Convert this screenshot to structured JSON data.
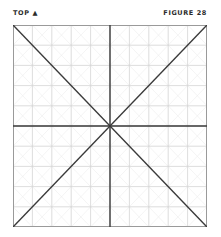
{
  "header": {
    "left_label": "TOP ▲",
    "right_label": "FIGURE 28"
  },
  "diagram": {
    "type": "grid-with-diagonals",
    "rows": 10,
    "columns": 10,
    "lines": [
      "diagonal-top-left-to-bottom-right",
      "diagonal-top-right-to-bottom-left",
      "horizontal-center",
      "vertical-center"
    ],
    "colors": {
      "grid": "#d4d4d4",
      "cell_diagonals": "#ececec",
      "main_lines": "#3a3a3a",
      "border": "#9a9a9a"
    }
  }
}
